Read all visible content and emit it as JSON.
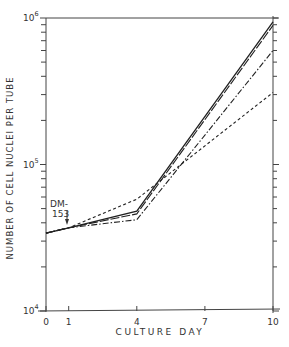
{
  "chart_data": {
    "type": "line",
    "title": "",
    "xlabel": "CULTURE DAY",
    "ylabel": "NUMBER OF CELL NUCLEI PER TUBE",
    "yscale": "log",
    "xlim": [
      0,
      10
    ],
    "ylim": [
      10000,
      1000000
    ],
    "x_ticks": [
      0,
      1,
      4,
      7,
      10
    ],
    "y_ticks": [
      {
        "value": 10000,
        "base": "10",
        "exp": "4"
      },
      {
        "value": 100000,
        "base": "10",
        "exp": "5"
      },
      {
        "value": 1000000,
        "base": "10",
        "exp": "6"
      }
    ],
    "grid": false,
    "legend": null,
    "annotations": [
      {
        "text_line1": "DM-",
        "text_line2": "153",
        "x": 1,
        "arrow": "down"
      }
    ],
    "x": [
      0,
      1,
      4,
      10
    ],
    "series": [
      {
        "name": "solid",
        "style": "solid",
        "values": [
          34000,
          37000,
          48000,
          940000
        ]
      },
      {
        "name": "long-dash",
        "style": "long-dash",
        "values": [
          34000,
          37000,
          46000,
          890000
        ]
      },
      {
        "name": "dash-dot",
        "style": "dash-dot",
        "values": [
          34000,
          37000,
          42000,
          600000
        ]
      },
      {
        "name": "short-dash",
        "style": "short-dash",
        "values": [
          34000,
          37000,
          58000,
          310000
        ]
      }
    ]
  },
  "labels": {
    "xlabel": "CULTURE DAY",
    "ylabel": "NUMBER OF CELL NUCLEI PER TUBE",
    "annotation_line1": "DM-",
    "annotation_line2": "153"
  }
}
